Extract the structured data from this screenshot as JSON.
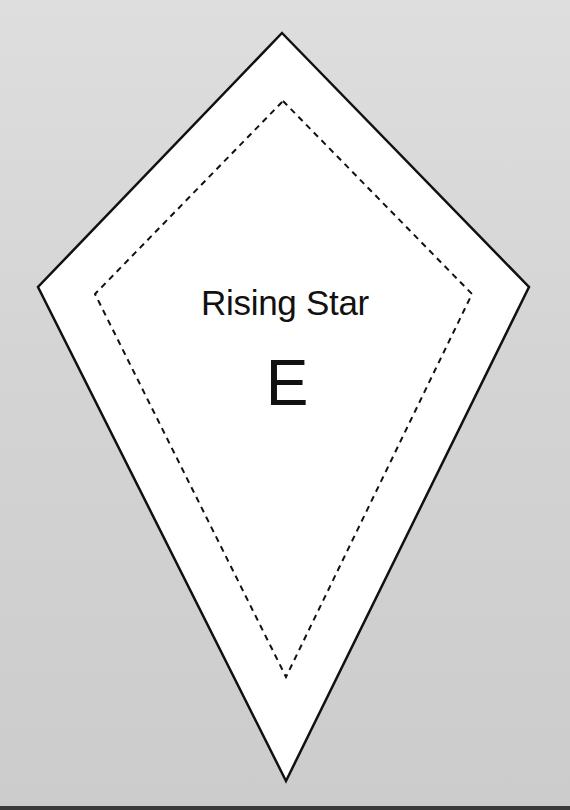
{
  "template": {
    "title": "Rising Star",
    "piece_letter": "E",
    "shape": "kite",
    "colors": {
      "background": "#d3d3d3",
      "piece_fill": "#ffffff",
      "outline": "#111111",
      "seam_line": "#111111",
      "bottom_edge": "#3a3a3a"
    },
    "outer_cut_line": {
      "style": "solid",
      "points": [
        [
          282,
          33
        ],
        [
          529,
          287
        ],
        [
          286,
          781
        ],
        [
          38,
          287
        ]
      ]
    },
    "inner_seam_line": {
      "style": "dashed",
      "points": [
        [
          283,
          101
        ],
        [
          472,
          294
        ],
        [
          286,
          677
        ],
        [
          95,
          294
        ]
      ]
    }
  }
}
